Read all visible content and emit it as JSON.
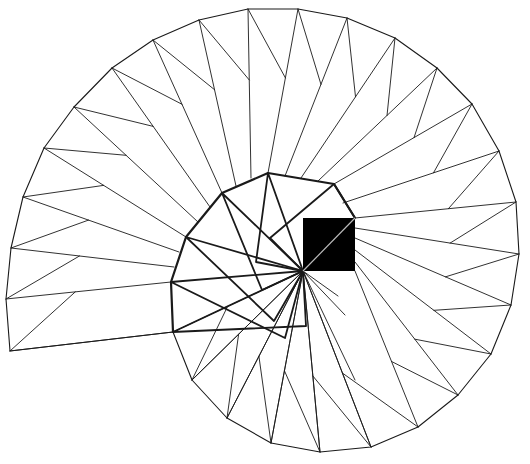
{
  "diagram": {
    "title": "Square-root spiral construction",
    "width": 530,
    "height": 464,
    "stroke_color": "#1a1a1a",
    "fill_color": "#000000",
    "background": "#ffffff",
    "pivot": [
      303,
      271
    ],
    "black_square": {
      "x": 303,
      "y": 218,
      "w": 52,
      "h": 53,
      "diagonal_color": "#bbbbbb"
    },
    "inner_spiral": [
      [
        355,
        218
      ],
      [
        334,
        184
      ],
      [
        268,
        173
      ],
      [
        222,
        193
      ],
      [
        186,
        237
      ],
      [
        171,
        282
      ],
      [
        173,
        332
      ]
    ],
    "inner_squares": [
      [
        [
          303,
          271
        ],
        [
          355,
          218
        ],
        [
          334,
          184
        ],
        [
          270,
          238
        ],
        [
          303,
          271
        ]
      ],
      [
        [
          303,
          271
        ],
        [
          268,
          173
        ],
        [
          256,
          262
        ],
        [
          303,
          271
        ]
      ],
      [
        [
          303,
          271
        ],
        [
          222,
          193
        ],
        [
          262,
          290
        ],
        [
          303,
          271
        ]
      ],
      [
        [
          303,
          271
        ],
        [
          186,
          237
        ],
        [
          274,
          321
        ],
        [
          303,
          271
        ]
      ],
      [
        [
          303,
          271
        ],
        [
          171,
          282
        ],
        [
          285,
          338
        ],
        [
          303,
          271
        ]
      ],
      [
        [
          303,
          271
        ],
        [
          173,
          332
        ],
        [
          306,
          326
        ],
        [
          303,
          271
        ]
      ]
    ],
    "pivot_rays": [
      [
        192,
        380
      ],
      [
        227,
        418
      ],
      [
        271,
        443
      ],
      [
        320,
        452
      ],
      [
        355,
        380
      ],
      [
        371,
        447
      ],
      [
        345,
        315
      ],
      [
        338,
        296
      ]
    ],
    "outer_ring": [
      [
        173,
        332
      ],
      [
        192,
        380
      ],
      [
        227,
        418
      ],
      [
        271,
        443
      ],
      [
        320,
        452
      ],
      [
        371,
        447
      ],
      [
        418,
        427
      ],
      [
        458,
        395
      ],
      [
        491,
        354
      ],
      [
        511,
        305
      ],
      [
        519,
        254
      ],
      [
        516,
        202
      ],
      [
        499,
        151
      ],
      [
        472,
        104
      ],
      [
        437,
        68
      ],
      [
        395,
        38
      ],
      [
        347,
        18
      ],
      [
        298,
        9
      ],
      [
        248,
        9
      ],
      [
        199,
        20
      ],
      [
        153,
        40
      ],
      [
        112,
        68
      ],
      [
        74,
        107
      ],
      [
        44,
        148
      ],
      [
        23,
        197
      ],
      [
        11,
        248
      ],
      [
        6,
        299
      ],
      [
        10,
        351
      ]
    ],
    "outer_anchor": [
      [
        303,
        271
      ],
      [
        303,
        271
      ],
      [
        303,
        271
      ],
      [
        303,
        271
      ],
      [
        303,
        271
      ],
      [
        303,
        271
      ],
      [
        355,
        271
      ],
      [
        355,
        262
      ],
      [
        355,
        250
      ],
      [
        355,
        238
      ],
      [
        355,
        228
      ],
      [
        355,
        218
      ],
      [
        343,
        203
      ],
      [
        334,
        184
      ],
      [
        318,
        181
      ],
      [
        301,
        178
      ],
      [
        285,
        176
      ],
      [
        268,
        173
      ],
      [
        251,
        178
      ],
      [
        236,
        186
      ],
      [
        222,
        193
      ],
      [
        210,
        207
      ],
      [
        198,
        222
      ],
      [
        186,
        237
      ],
      [
        179,
        252
      ],
      [
        174,
        267
      ],
      [
        171,
        282
      ],
      [
        173,
        332
      ]
    ],
    "fold_ratio": 0.42
  }
}
